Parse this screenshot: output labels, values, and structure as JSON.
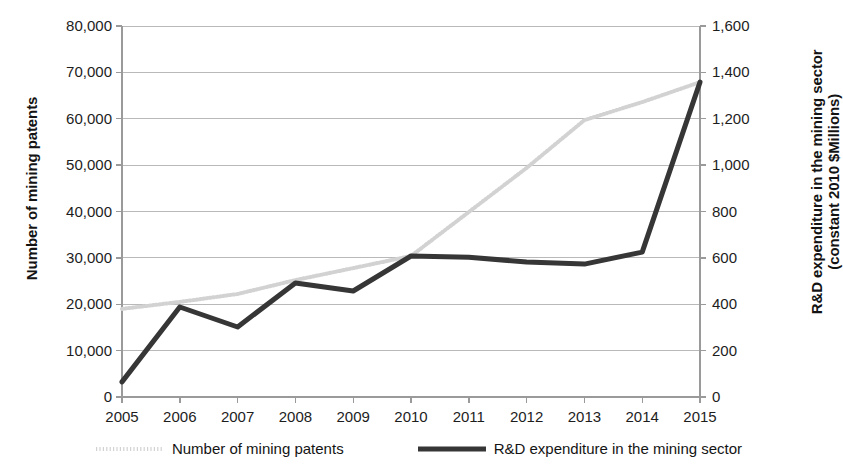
{
  "chart_data": {
    "type": "line",
    "title": "",
    "xlabel": "",
    "x": [
      2005,
      2006,
      2007,
      2008,
      2009,
      2010,
      2011,
      2012,
      2013,
      2014,
      2015
    ],
    "xtick_labels": [
      "2005",
      "2006",
      "2007",
      "2008",
      "2009",
      "2010",
      "2011",
      "2012",
      "2013",
      "2014",
      "2015"
    ],
    "grid": true,
    "legend_position": "bottom",
    "axes": {
      "left": {
        "label": "Number of mining patents",
        "ylim": [
          0,
          80000
        ],
        "tick_step": 10000,
        "tick_labels": [
          "80,000",
          "70,000",
          "60,000",
          "50,000",
          "40,000",
          "30,000",
          "20,000",
          "10,000",
          "0"
        ],
        "tick_values": [
          80000,
          70000,
          60000,
          50000,
          40000,
          30000,
          20000,
          10000,
          0
        ]
      },
      "right": {
        "label": "R&D expenditure in the mining sector\n(constant 2010 $Millions)",
        "label_line1": "R&D expenditure in the mining sector",
        "label_line2": "(constant 2010 $Millions)",
        "ylim": [
          0,
          1600
        ],
        "tick_step": 200,
        "tick_labels": [
          "1,600",
          "1,400",
          "1,200",
          "1,000",
          "800",
          "600",
          "400",
          "200",
          "0"
        ],
        "tick_values": [
          1600,
          1400,
          1200,
          1000,
          800,
          600,
          400,
          200,
          0
        ]
      }
    },
    "series": [
      {
        "name": "Number of mining patents",
        "axis": "left",
        "color": "#d2d2d2",
        "style": "dotted",
        "width": 4,
        "values": [
          19000,
          20500,
          22200,
          25200,
          27800,
          30400,
          39900,
          49400,
          59700,
          63600,
          67900
        ]
      },
      {
        "name": "R&D expenditure in the mining sector",
        "axis": "right",
        "color": "#363636",
        "style": "solid",
        "width": 5,
        "values": [
          65,
          388,
          302,
          492,
          457,
          608,
          603,
          582,
          573,
          625,
          1358
        ]
      }
    ]
  },
  "legend": {
    "items": [
      {
        "label": "Number of mining patents",
        "color": "#d2d2d2",
        "style": "dotted"
      },
      {
        "label": "R&D expenditure in the mining sector",
        "color": "#363636",
        "style": "solid"
      }
    ]
  },
  "colors": {
    "patents_line": "#d2d2d2",
    "rnd_line": "#363636",
    "gridline": "#b9b9b9",
    "axis": "#9a9a9a",
    "text": "#1a1a1a",
    "background": "#ffffff"
  }
}
